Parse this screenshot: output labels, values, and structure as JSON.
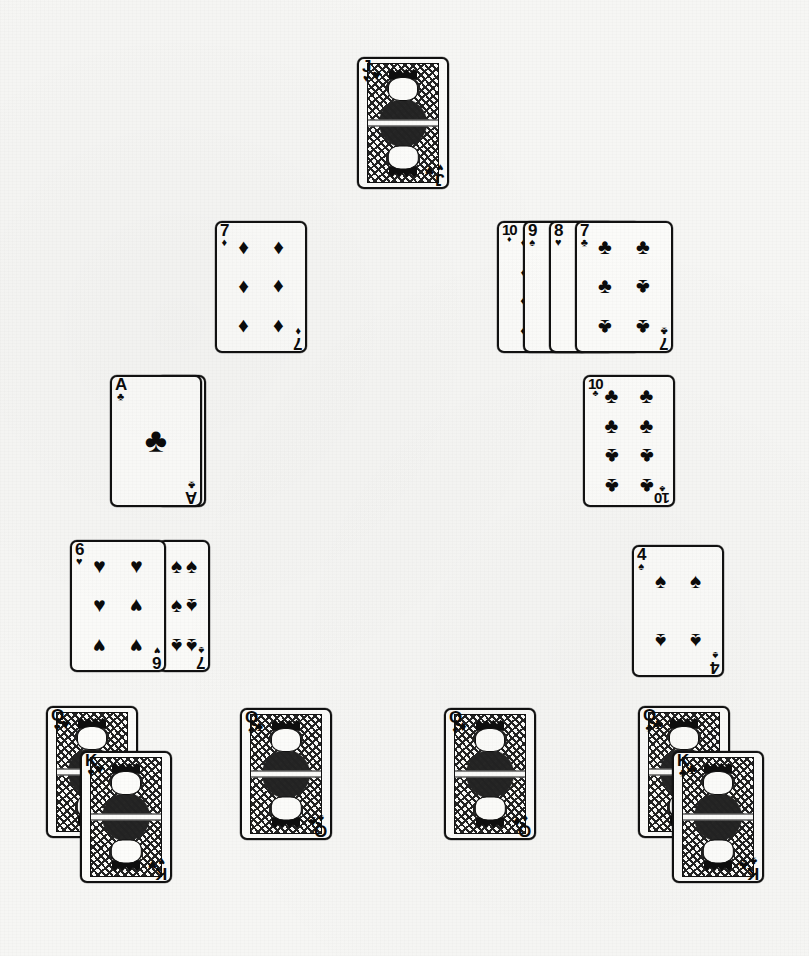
{
  "scene": {
    "title": "Playing card tableau",
    "background_color": "#f6f6f4",
    "card_face_color": "#fbfbf9",
    "ink_color": "#0b0b0b",
    "card_width": 92,
    "card_height": 132,
    "total_cards_visible": 19
  },
  "suits": {
    "hearts": "♥",
    "diamonds": "♦",
    "clubs": "♣",
    "spades": "♠"
  },
  "groups": [
    {
      "name": "foundation-top",
      "x": 357,
      "y": 57,
      "cards": [
        {
          "rank": "J",
          "suit": "hearts",
          "glyph": "♥",
          "type": "face",
          "dx": 0,
          "dy": 0,
          "w": 92,
          "h": 132,
          "label": "Jack of Hearts"
        }
      ]
    },
    {
      "name": "pile-seven-diamonds",
      "x": 215,
      "y": 221,
      "cards": [
        {
          "rank": "7",
          "suit": "diamonds",
          "glyph": "♦",
          "type": "pip",
          "dx": 0,
          "dy": 0,
          "w": 92,
          "h": 132,
          "label": "Seven of Diamonds"
        }
      ]
    },
    {
      "name": "run-ten-to-seven",
      "x": 497,
      "y": 221,
      "cards": [
        {
          "rank": "10",
          "suit": "diamonds",
          "glyph": "♦",
          "type": "pip",
          "dx": 0,
          "dy": 0,
          "w": 92,
          "h": 132,
          "label": "Ten of Diamonds"
        },
        {
          "rank": "9",
          "suit": "spades",
          "glyph": "♠",
          "type": "pip",
          "dx": 26,
          "dy": 0,
          "w": 92,
          "h": 132,
          "label": "Nine of Spades"
        },
        {
          "rank": "8",
          "suit": "hearts",
          "glyph": "♥",
          "type": "pip",
          "dx": 52,
          "dy": 0,
          "w": 92,
          "h": 132,
          "label": "Eight of Hearts"
        },
        {
          "rank": "7",
          "suit": "clubs",
          "glyph": "♣",
          "type": "pip",
          "dx": 78,
          "dy": 0,
          "w": 98,
          "h": 132,
          "label": "Seven of Clubs"
        }
      ]
    },
    {
      "name": "pile-ace-clubs",
      "x": 110,
      "y": 375,
      "cards": [
        {
          "rank": "2",
          "suit": "diamonds",
          "glyph": "♦",
          "type": "blank",
          "dx": 46,
          "dy": 0,
          "w": 50,
          "h": 132,
          "label": "Two of Diamonds (covered)"
        },
        {
          "rank": "A",
          "suit": "clubs",
          "glyph": "♣",
          "type": "ace",
          "dx": 0,
          "dy": 0,
          "w": 92,
          "h": 132,
          "label": "Ace of Clubs"
        }
      ]
    },
    {
      "name": "pile-ten-clubs",
      "x": 583,
      "y": 375,
      "cards": [
        {
          "rank": "10",
          "suit": "clubs",
          "glyph": "♣",
          "type": "pip",
          "dx": 0,
          "dy": 0,
          "w": 92,
          "h": 132,
          "label": "Ten of Clubs"
        }
      ]
    },
    {
      "name": "pile-six-hearts",
      "x": 70,
      "y": 540,
      "cards": [
        {
          "rank": "7",
          "suit": "spades",
          "glyph": "♠",
          "type": "sliver",
          "dx": 88,
          "dy": 0,
          "w": 52,
          "h": 132,
          "label": "Seven of Spades (covered)"
        },
        {
          "rank": "6",
          "suit": "hearts",
          "glyph": "♥",
          "type": "pip",
          "dx": 0,
          "dy": 0,
          "w": 96,
          "h": 132,
          "label": "Six of Hearts"
        }
      ]
    },
    {
      "name": "pile-four-spades",
      "x": 632,
      "y": 545,
      "cards": [
        {
          "rank": "4",
          "suit": "spades",
          "glyph": "♠",
          "type": "pip",
          "dx": 0,
          "dy": 0,
          "w": 92,
          "h": 132,
          "label": "Four of Spades"
        }
      ]
    },
    {
      "name": "pile-queen-king-hearts",
      "x": 46,
      "y": 706,
      "cards": [
        {
          "rank": "Q",
          "suit": "hearts",
          "glyph": "♥",
          "type": "face",
          "dx": 0,
          "dy": 0,
          "w": 92,
          "h": 132,
          "label": "Queen of Hearts"
        },
        {
          "rank": "K",
          "suit": "hearts",
          "glyph": "♥",
          "type": "face",
          "dx": 34,
          "dy": 45,
          "w": 92,
          "h": 132,
          "label": "King of Hearts"
        }
      ]
    },
    {
      "name": "pile-queen-spades",
      "x": 240,
      "y": 708,
      "cards": [
        {
          "rank": "Q",
          "suit": "spades",
          "glyph": "♠",
          "type": "face",
          "dx": 0,
          "dy": 0,
          "w": 92,
          "h": 132,
          "label": "Queen of Spades"
        }
      ]
    },
    {
      "name": "pile-queen-diamonds",
      "x": 444,
      "y": 708,
      "cards": [
        {
          "rank": "Q",
          "suit": "diamonds",
          "glyph": "♦",
          "type": "face",
          "dx": 0,
          "dy": 0,
          "w": 92,
          "h": 132,
          "label": "Queen of Diamonds"
        }
      ]
    },
    {
      "name": "pile-queen-king-clubs",
      "x": 638,
      "y": 706,
      "cards": [
        {
          "rank": "Q",
          "suit": "clubs",
          "glyph": "♣",
          "type": "face",
          "dx": 0,
          "dy": 0,
          "w": 92,
          "h": 132,
          "label": "Queen of Clubs"
        },
        {
          "rank": "K",
          "suit": "clubs",
          "glyph": "♣",
          "type": "face",
          "dx": 34,
          "dy": 45,
          "w": 92,
          "h": 132,
          "label": "King of Clubs"
        }
      ]
    }
  ],
  "pip_layouts": {
    "A": {
      "rows": 1,
      "cols": 1
    },
    "2": {
      "rows": 4,
      "cols": 1
    },
    "4": {
      "rows": 2,
      "cols": 2
    },
    "6": {
      "rows": 3,
      "cols": 2
    },
    "7": {
      "rows": 3,
      "cols": 2
    },
    "8": {
      "rows": 4,
      "cols": 1
    },
    "9": {
      "rows": 4,
      "cols": 1
    },
    "10": {
      "rows": 4,
      "cols": 2
    }
  }
}
